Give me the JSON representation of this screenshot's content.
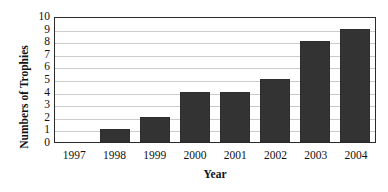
{
  "chart_data": {
    "type": "bar",
    "title": "",
    "subtitle": "",
    "xlabel": "Year",
    "ylabel": "Numbers of Trophies",
    "categories": [
      "1997",
      "1998",
      "1999",
      "2000",
      "2001",
      "2002",
      "2003",
      "2004"
    ],
    "values": [
      0,
      1,
      2,
      4,
      4,
      5,
      8,
      9
    ],
    "series": [
      {
        "name": "Trophies",
        "values": [
          0,
          1,
          2,
          4,
          4,
          5,
          8,
          9
        ]
      }
    ],
    "ylim": [
      0,
      10
    ],
    "ytick_labels": [
      "10",
      "9",
      "8",
      "7",
      "6",
      "5",
      "4",
      "3",
      "2",
      "1",
      "0"
    ],
    "ytick_values": [
      10,
      9,
      8,
      7,
      6,
      5,
      4,
      3,
      2,
      1,
      0
    ],
    "ytick_step": 1,
    "grid": "horizontal",
    "legend": "none",
    "legend_position": "",
    "annotations": [],
    "bar_color": "#333333",
    "gridline_color": "#cbcbcb",
    "axis_color": "#2b2b2b",
    "background_color": "#ffffff"
  }
}
